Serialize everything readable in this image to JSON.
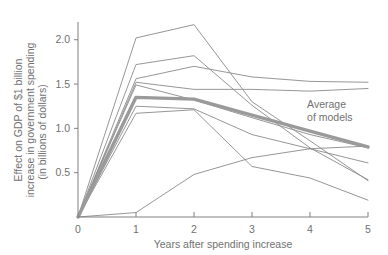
{
  "chart_data": {
    "type": "line",
    "title": "",
    "xlabel": "Years after spending increase",
    "ylabel": "Effect on GDP of $1 billion increase in government spending (in billions of dollars)",
    "ylabel_lines": [
      "Effect on GDP of $1 billion",
      "increase in government spending",
      "(in billions of dollars)"
    ],
    "x": [
      0,
      1,
      2,
      3,
      4,
      5
    ],
    "xlim": [
      0,
      5
    ],
    "ylim": [
      0,
      2.2
    ],
    "xticks": [
      "0",
      "1",
      "2",
      "3",
      "4",
      "5"
    ],
    "yticks": [
      "0.5",
      "1.0",
      "1.5",
      "2.0"
    ],
    "ytick_values": [
      0.5,
      1.0,
      1.5,
      2.0
    ],
    "grid": false,
    "legend": "none",
    "annotations": [
      {
        "name": "average-of-models",
        "lines": [
          "Average",
          "of models"
        ],
        "x": 3.95,
        "y": 1.23
      }
    ],
    "series": [
      {
        "name": "model-1",
        "values": [
          0.0,
          2.02,
          2.17,
          1.3,
          0.86,
          0.41
        ],
        "emphasis": false
      },
      {
        "name": "model-2",
        "values": [
          0.0,
          1.72,
          1.82,
          1.26,
          0.78,
          0.42
        ],
        "emphasis": false
      },
      {
        "name": "model-3",
        "values": [
          0.0,
          1.56,
          1.7,
          1.58,
          1.53,
          1.52
        ],
        "emphasis": false
      },
      {
        "name": "model-4",
        "values": [
          0.0,
          1.52,
          1.44,
          1.44,
          1.42,
          1.45
        ],
        "emphasis": false
      },
      {
        "name": "model-5",
        "values": [
          0.0,
          1.49,
          1.32,
          1.12,
          0.93,
          0.78
        ],
        "emphasis": false
      },
      {
        "name": "model-6",
        "values": [
          0.0,
          1.25,
          1.22,
          0.93,
          0.77,
          0.61
        ],
        "emphasis": false
      },
      {
        "name": "model-7",
        "values": [
          0.0,
          1.17,
          1.21,
          0.57,
          0.44,
          0.19
        ],
        "emphasis": false
      },
      {
        "name": "model-8",
        "values": [
          0.0,
          0.05,
          0.48,
          0.67,
          0.77,
          0.8
        ],
        "emphasis": false
      },
      {
        "name": "average-of-models",
        "values": [
          0.0,
          1.35,
          1.33,
          1.15,
          0.97,
          0.79
        ],
        "emphasis": true
      }
    ],
    "colors": {
      "model_line": "#8a8a8a",
      "average_line": "#9a9a9a",
      "axis": "#808080",
      "text": "#717171",
      "background": "#ffffff"
    }
  }
}
